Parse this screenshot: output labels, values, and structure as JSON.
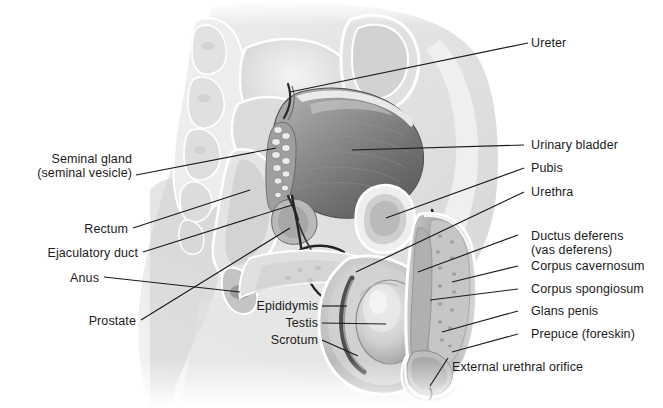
{
  "figure": {
    "background_color": "#ffffff",
    "leader_line_color": "#1b1b1b",
    "text_color": "#1b1b1b"
  },
  "labels_left": [
    {
      "name": "seminal-gland",
      "line1": "Seminal gland",
      "line2": "(seminal vesicle)"
    },
    {
      "name": "rectum",
      "line1": "Rectum"
    },
    {
      "name": "ejaculatory-duct",
      "line1": "Ejaculatory duct"
    },
    {
      "name": "anus",
      "line1": "Anus"
    },
    {
      "name": "prostate",
      "line1": "Prostate"
    }
  ],
  "labels_center": [
    {
      "name": "epididymis",
      "line1": "Epididymis"
    },
    {
      "name": "testis",
      "line1": "Testis"
    },
    {
      "name": "scrotum",
      "line1": "Scrotum"
    }
  ],
  "labels_right": [
    {
      "name": "ureter",
      "line1": "Ureter"
    },
    {
      "name": "urinary-bladder",
      "line1": "Urinary bladder"
    },
    {
      "name": "pubis",
      "line1": "Pubis"
    },
    {
      "name": "urethra",
      "line1": "Urethra"
    },
    {
      "name": "ductus-deferens",
      "line1": "Ductus deferens",
      "line2": "(vas deferens)"
    },
    {
      "name": "corpus-cavernosum",
      "line1": "Corpus cavernosum"
    },
    {
      "name": "corpus-spongiosum",
      "line1": "Corpus spongiosum"
    },
    {
      "name": "glans-penis",
      "line1": "Glans penis"
    },
    {
      "name": "prepuce",
      "line1": "Prepuce (foreskin)"
    }
  ],
  "labels_bottom": [
    {
      "name": "external-urethral-orifice",
      "line1": "External urethral orifice"
    }
  ]
}
